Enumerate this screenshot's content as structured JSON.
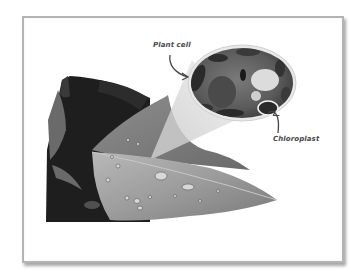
{
  "figure": {
    "labels": {
      "plant_cell": "Plant cell",
      "chloroplast": "Chloroplast"
    },
    "icons": {
      "plant_cell_arrow": "curved-arrow-icon",
      "chloroplast_arrow": "curved-arrow-icon"
    },
    "colors": {
      "frame_border": "#b4b4b4",
      "background": "#ffffff",
      "label_text": "#4a4a4a",
      "leaf_light": "#a8a8a8",
      "leaf_dark": "#1c1c1c"
    }
  }
}
